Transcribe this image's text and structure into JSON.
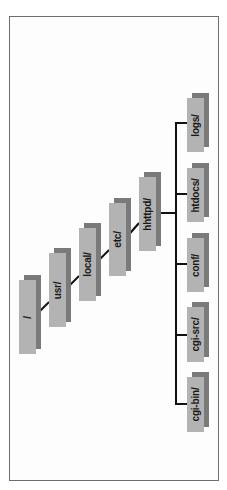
{
  "diagram": {
    "type": "directory-tree",
    "orientation": "rotated-90",
    "colors": {
      "frame_border": "#6e6e6e",
      "box_face": "#b3b3b3",
      "box_shadow": "#7a7a7a",
      "connector": "#111111",
      "text": "#1a1a1a"
    },
    "chain": [
      {
        "label": "/"
      },
      {
        "label": "usr/"
      },
      {
        "label": "local/"
      },
      {
        "label": "etc/"
      },
      {
        "label": "hhttpd/"
      }
    ],
    "children": [
      {
        "label": "logs/"
      },
      {
        "label": "htdocs/"
      },
      {
        "label": "conf/"
      },
      {
        "label": "cgi-src/"
      },
      {
        "label": "cgi-bin/"
      }
    ]
  }
}
